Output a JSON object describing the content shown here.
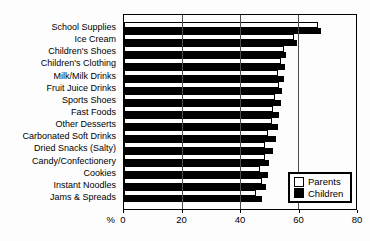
{
  "chart_data": {
    "type": "bar",
    "orientation": "horizontal",
    "title": "",
    "xlabel": "%",
    "ylabel": "",
    "xlim": [
      0,
      80
    ],
    "xticks": [
      0,
      20,
      40,
      60,
      80
    ],
    "gridlines_at": [
      20,
      40,
      60
    ],
    "grid": "on",
    "legend_position": "bottom-right",
    "categories": [
      "School Supplies",
      "Ice Cream",
      "Children's Shoes",
      "Children's Clothing",
      "Milk/Milk Drinks",
      "Fruit Juice Drinks",
      "Sports Shoes",
      "Fast Foods",
      "Other Desserts",
      "Carbonated Soft Drinks",
      "Dried Snacks (Salty)",
      "Candy/Confectionery",
      "Cookies",
      "Instant Noodles",
      "Jams & Spreads"
    ],
    "series": [
      {
        "name": "Parents",
        "color": "#ffffff",
        "values": [
          67,
          58.5,
          55,
          54,
          53,
          53.5,
          52,
          51.5,
          51,
          49.5,
          48.5,
          48.5,
          47,
          47.5,
          45.5
        ]
      },
      {
        "name": "Children",
        "color": "#000000",
        "values": [
          68,
          59.5,
          56,
          55.5,
          55,
          54.5,
          54,
          53.5,
          53,
          52.5,
          51.5,
          50,
          49.5,
          49,
          47.5
        ]
      }
    ]
  }
}
